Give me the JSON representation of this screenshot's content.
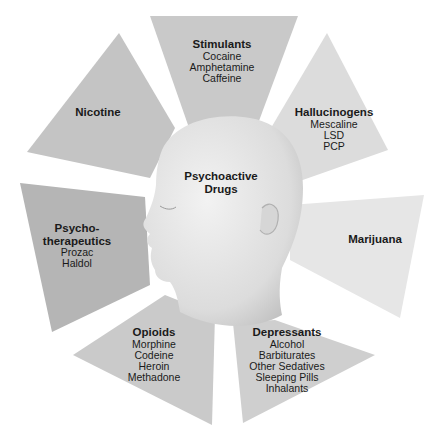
{
  "diagram": {
    "center": {
      "line1": "Psychoactive",
      "line2": "Drugs"
    },
    "colors": {
      "background": "#ffffff",
      "segment_light": "#d9d9d9",
      "segment_mid": "#c4c4c4",
      "segment_dark": "#b0b0b0",
      "head": "#e4e4e4",
      "text": "#1a1a1a"
    },
    "segments": [
      {
        "title": "Stimulants",
        "items": [
          "Cocaine",
          "Amphetamine",
          "Caffeine"
        ]
      },
      {
        "title": "Hallucinogens",
        "items": [
          "Mescaline",
          "LSD",
          "PCP"
        ]
      },
      {
        "title": "Marijuana",
        "items": []
      },
      {
        "title": "Depressants",
        "items": [
          "Alcohol",
          "Barbiturates",
          "Other Sedatives",
          "Sleeping Pills",
          "Inhalants"
        ]
      },
      {
        "title": "Opioids",
        "items": [
          "Morphine",
          "Codeine",
          "Heroin",
          "Methadone"
        ]
      },
      {
        "title_line1": "Psycho-",
        "title_line2": "therapeutics",
        "items": [
          "Prozac",
          "Haldol"
        ]
      },
      {
        "title": "Nicotine",
        "items": []
      }
    ]
  }
}
